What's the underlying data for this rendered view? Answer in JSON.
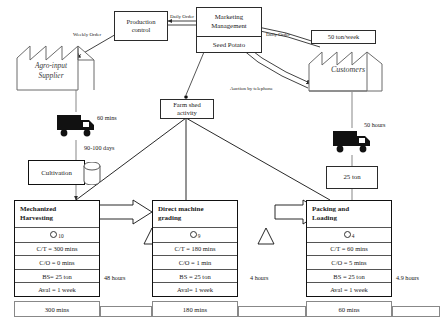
{
  "diagram": {
    "supplier": {
      "name": "Agro-input\nSupplier",
      "line1": "Agro-input",
      "line2": "Supplier",
      "icon": "factory-icon"
    },
    "customers": {
      "name": "Customers",
      "icon": "factory-icon"
    },
    "demand_box": {
      "value": "50 ton/week"
    },
    "production_control": {
      "line1": "Production",
      "line2": "control"
    },
    "marketing": {
      "line1": "Marketing",
      "line2": "Management",
      "sub": "Seed Potato"
    },
    "farm_shed": {
      "line1": "Farm shed",
      "line2": "activity"
    },
    "cultivation": {
      "label": "Cultivation",
      "icon": "database-cylinder-icon"
    },
    "shipment_box": {
      "value": "25 ton"
    },
    "flow_labels": {
      "weekly_order": "Weekly Order",
      "daily_order_top": "Daily Order",
      "daily_order_right": "Daily Order",
      "auction": "Auction by telephone",
      "supplier_lead": "60 mins",
      "cultivation_lead": "90-100 days",
      "delivery_lead": "50 hours"
    },
    "processes": [
      {
        "name": "Mechanized Harvesting",
        "title_line1": "Mechanized",
        "title_line2": "Harvesting",
        "operators": "10",
        "rows": [
          "C/T = 300 mins",
          "C/O = 0 mins",
          "BS= 25 ton",
          "Aval = 1 week"
        ],
        "cycle_time": "300 mins"
      },
      {
        "name": "Direct machine grading",
        "title_line1": "Direct machine",
        "title_line2": "grading",
        "operators": "9",
        "rows": [
          "C/T = 180 mins",
          "C/O = 1 min",
          "BS = 25 ton",
          "Aval= 1 week"
        ],
        "cycle_time": "180 mins"
      },
      {
        "name": "Packing and Loading",
        "title_line1": "Packing and",
        "title_line2": "Loading",
        "operators": "4",
        "rows": [
          "C/T = 60 mins",
          "C/O = 5 mins",
          "BS = 25 ton",
          "Aval = 1 week"
        ],
        "cycle_time": "60 mins"
      }
    ],
    "lead_times": [
      "48 hours",
      "4 hours",
      "4.9 hours"
    ],
    "colors": {
      "line": "#2b2b2b",
      "text": "#1a1a1a",
      "box_border": "#555555"
    }
  }
}
